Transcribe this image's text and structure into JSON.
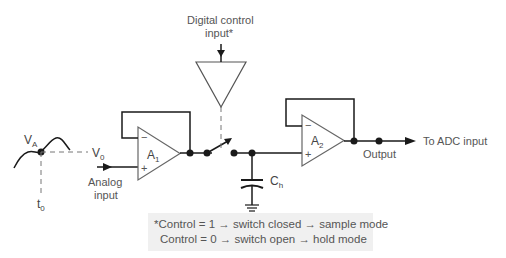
{
  "diagram": {
    "type": "sample-and-hold circuit",
    "labels": {
      "control_input": "Digital control",
      "control_input_line2": "input*",
      "va": "V",
      "va_sub": "A",
      "v0": "V",
      "v0_sub": "0",
      "t0": "t",
      "t0_sub": "0",
      "analog_input_line1": "Analog",
      "analog_input_line2": "input",
      "a1": "A",
      "a1_sub": "1",
      "a2": "A",
      "a2_sub": "2",
      "ch": "C",
      "ch_sub": "h",
      "output": "Output",
      "to_adc": "To ADC input",
      "minus": "−",
      "plus": "+"
    },
    "note": {
      "line1": "*Control = 1 → switch closed → sample mode",
      "line2": "Control = 0 → switch open → hold mode"
    },
    "colors": {
      "line": "#1a1a1a",
      "text": "#555555",
      "note_bg": "#f0f0f0"
    }
  }
}
